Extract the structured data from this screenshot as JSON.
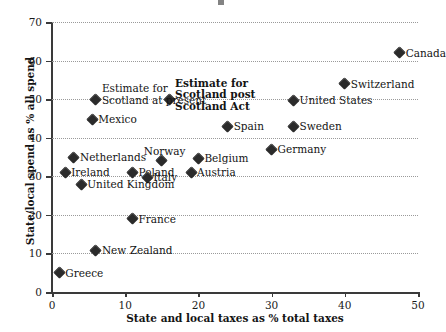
{
  "chart_data": {
    "type": "scatter",
    "title": "",
    "xlabel": "State and local taxes as % total taxes",
    "ylabel": "State/local spend as % all spend",
    "xlim": [
      0,
      50
    ],
    "ylim": [
      0,
      70
    ],
    "xticks": [
      0,
      10,
      20,
      30,
      40,
      50
    ],
    "yticks": [
      0,
      10,
      20,
      30,
      40,
      50,
      60,
      70
    ],
    "grid": "horizontal-dotted",
    "legend": "none",
    "marker": "diamond",
    "marker_color": "#2b2b2b",
    "points": [
      {
        "label": "Canada",
        "x": 47.5,
        "y": 62.0,
        "label_pos": "right",
        "bold": false
      },
      {
        "label": "Switzerland",
        "x": 40.0,
        "y": 54.0,
        "label_pos": "right",
        "bold": false
      },
      {
        "label": "United States",
        "x": 33.0,
        "y": 49.7,
        "label_pos": "right",
        "bold": false
      },
      {
        "label": "Estimate for\nScotland post\nScotland Act",
        "x": 16.0,
        "y": 50.0,
        "label_pos": "right",
        "bold": true
      },
      {
        "label": "Estimate for\nScotland at present",
        "x": 6.0,
        "y": 50.0,
        "label_pos": "right",
        "bold": false
      },
      {
        "label": "Mexico",
        "x": 5.5,
        "y": 44.8,
        "label_pos": "right",
        "bold": false
      },
      {
        "label": "Sweden",
        "x": 33.0,
        "y": 43.0,
        "label_pos": "right",
        "bold": false
      },
      {
        "label": "Spain",
        "x": 24.0,
        "y": 43.0,
        "label_pos": "right",
        "bold": false
      },
      {
        "label": "Germany",
        "x": 30.0,
        "y": 37.0,
        "label_pos": "right",
        "bold": false
      },
      {
        "label": "Netherlands",
        "x": 3.0,
        "y": 35.0,
        "label_pos": "right",
        "bold": false
      },
      {
        "label": "Belgium",
        "x": 20.0,
        "y": 34.7,
        "label_pos": "right",
        "bold": false
      },
      {
        "label": "Norway",
        "x": 15.0,
        "y": 34.0,
        "label_pos": "above",
        "bold": false
      },
      {
        "label": "Ireland",
        "x": 1.8,
        "y": 31.0,
        "label_pos": "right",
        "bold": false
      },
      {
        "label": "Austria",
        "x": 19.0,
        "y": 31.0,
        "label_pos": "right",
        "bold": false
      },
      {
        "label": "Poland",
        "x": 11.0,
        "y": 31.0,
        "label_pos": "right",
        "bold": false
      },
      {
        "label": "Italy",
        "x": 13.0,
        "y": 29.7,
        "label_pos": "right",
        "bold": false
      },
      {
        "label": "United Kingdom",
        "x": 4.0,
        "y": 28.0,
        "label_pos": "right",
        "bold": false
      },
      {
        "label": "France",
        "x": 11.0,
        "y": 19.0,
        "label_pos": "right",
        "bold": false
      },
      {
        "label": "New Zealand",
        "x": 6.0,
        "y": 10.8,
        "label_pos": "right",
        "bold": false
      },
      {
        "label": "Greece",
        "x": 1.0,
        "y": 5.0,
        "label_pos": "right",
        "bold": false
      }
    ]
  }
}
